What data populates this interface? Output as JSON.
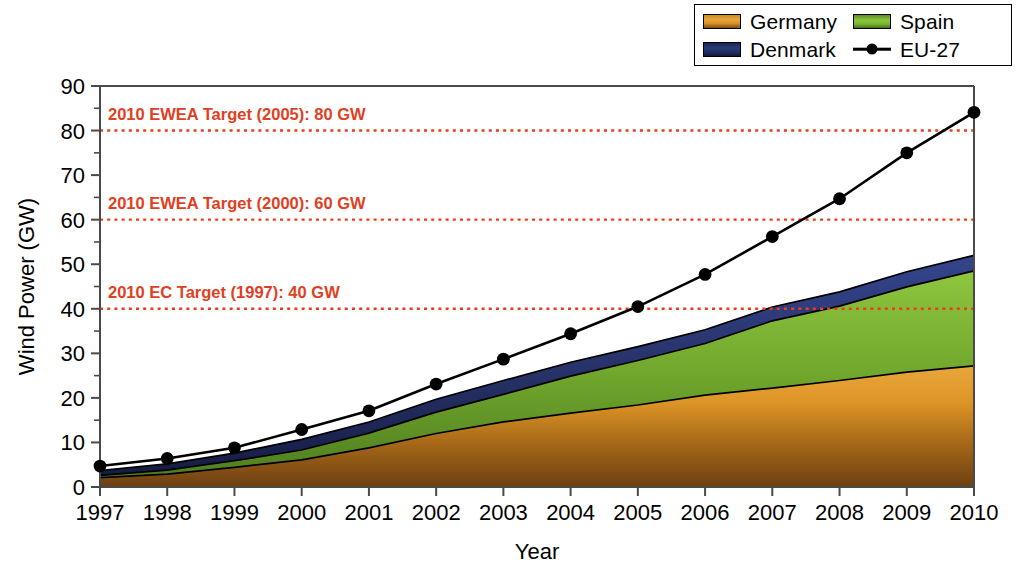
{
  "chart_data": {
    "type": "area",
    "title": "",
    "xlabel": "Year",
    "ylabel": "Wind Power (GW)",
    "xlim": [
      1997,
      2010
    ],
    "ylim": [
      0,
      90
    ],
    "ytick_step": 10,
    "grid": false,
    "legend_position": "top-right",
    "categories": [
      1997,
      1998,
      1999,
      2000,
      2001,
      2002,
      2003,
      2004,
      2005,
      2006,
      2007,
      2008,
      2009,
      2010
    ],
    "tick_labels_x": [
      "1997",
      "1998",
      "1999",
      "2000",
      "2001",
      "2002",
      "2003",
      "2004",
      "2005",
      "2006",
      "2007",
      "2008",
      "2009",
      "2010"
    ],
    "tick_labels_y": [
      "0",
      "10",
      "20",
      "30",
      "40",
      "50",
      "60",
      "70",
      "80",
      "90"
    ],
    "stacked": true,
    "stack_order": [
      "Germany",
      "Spain",
      "Denmark"
    ],
    "series": [
      {
        "name": "Germany",
        "color": "#d08a1f",
        "values": [
          2.1,
          2.9,
          4.4,
          6.1,
          8.8,
          12.0,
          14.6,
          16.6,
          18.4,
          20.6,
          22.2,
          23.9,
          25.8,
          27.2
        ]
      },
      {
        "name": "Spain",
        "color": "#7fb434",
        "values": [
          0.5,
          0.9,
          1.5,
          2.2,
          3.3,
          4.8,
          6.2,
          8.3,
          10.0,
          11.6,
          15.1,
          16.7,
          19.1,
          21.3
        ]
      },
      {
        "name": "Denmark",
        "color": "#22306e",
        "values": [
          1.1,
          1.4,
          1.7,
          2.4,
          2.5,
          2.9,
          3.1,
          3.1,
          3.1,
          3.1,
          3.1,
          3.2,
          3.4,
          3.5
        ]
      }
    ],
    "line_series": {
      "name": "EU-27",
      "color": "#000000",
      "marker": "circle",
      "values": [
        4.7,
        6.4,
        8.8,
        12.9,
        17.1,
        23.1,
        28.7,
        34.4,
        40.5,
        47.7,
        56.2,
        64.7,
        75.0,
        84.1
      ]
    },
    "annotations": [
      {
        "label": "2010 EWEA Target (2005): 80 GW",
        "value": 80,
        "color": "#e1401f"
      },
      {
        "label": "2010 EWEA Target (2000): 60 GW",
        "value": 60,
        "color": "#e1401f"
      },
      {
        "label": "2010 EC Target (1997): 40 GW",
        "value": 40,
        "color": "#e1401f"
      }
    ]
  },
  "legend": {
    "items": [
      {
        "label": "Germany",
        "swatch": "germany-swatch"
      },
      {
        "label": "Spain",
        "swatch": "spain-swatch"
      },
      {
        "label": "Denmark",
        "swatch": "denmark-swatch"
      },
      {
        "label": "EU-27",
        "swatch": "eu27-line-marker"
      }
    ]
  }
}
